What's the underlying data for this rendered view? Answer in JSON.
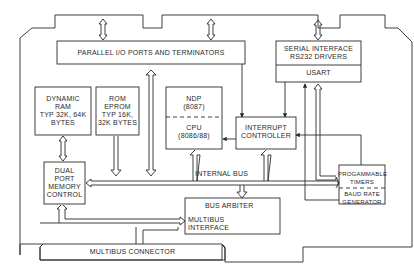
{
  "diagram": {
    "type": "block-diagram",
    "blocks": {
      "parallel_io": {
        "label": "PARALLEL I/O PORTS AND TERMINATORS"
      },
      "serial_interface": {
        "label": "SERIAL INTERFACE\nRS232 DRIVERS",
        "sub_label": "USART"
      },
      "dynamic_ram": {
        "label": "DYNAMIC\nRAM\nTYP 32K, 64K\nBYTES"
      },
      "rom_eprom": {
        "label": "ROM\nEPROM\nTYP 16K,\n32K BYTES"
      },
      "ndp": {
        "label": "NDP\n(8087)"
      },
      "cpu": {
        "label": "CPU\n(8086/88)"
      },
      "interrupt_controller": {
        "label": "INTERRUPT\nCONTROLLER"
      },
      "dual_port_memory_control": {
        "label": "DUAL\nPORT\nMEMORY\nCONTROL"
      },
      "internal_bus": {
        "label": "INTERNAL BUS"
      },
      "bus_arbiter": {
        "label": "BUS ARBITER"
      },
      "multibus_interface": {
        "label": "MULTIBUS\nINTERFACE"
      },
      "programmable_timers": {
        "label": "PROGAMMABLE\nTIMERS"
      },
      "baud_rate_generator": {
        "label": "BAUD RATE\nGENERATOR"
      },
      "multibus_connector": {
        "label": "MULTIBUS CONNECTOR"
      }
    },
    "colors": {
      "line": "#2a2a2a",
      "background": "#ffffff"
    }
  }
}
